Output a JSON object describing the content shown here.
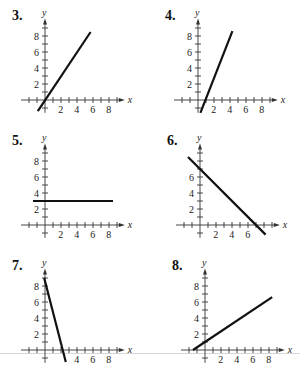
{
  "chart_data": [
    {
      "id": "3",
      "label": "3.",
      "type": "line",
      "xlabel": "x",
      "ylabel": "y",
      "xticks": [
        2,
        4,
        6,
        8
      ],
      "yticks": [
        2,
        4,
        6,
        8
      ],
      "origin_px": [
        45,
        100
      ],
      "segment": {
        "x1": -0.9,
        "y1": -1.4,
        "x2": 5.7,
        "y2": 8.5
      },
      "equation_estimate": "y = 1.5x"
    },
    {
      "id": "4",
      "label": "4.",
      "type": "line",
      "xlabel": "x",
      "ylabel": "y",
      "xticks": [
        2,
        4,
        6,
        8
      ],
      "yticks": [
        2,
        4,
        6,
        8
      ],
      "origin_px": [
        198,
        100
      ],
      "segment": {
        "x1": 0.3,
        "y1": -1.6,
        "x2": 4.3,
        "y2": 8.6
      },
      "equation_estimate": "y = 2.5x - 2"
    },
    {
      "id": "5",
      "label": "5.",
      "type": "line",
      "xlabel": "x",
      "ylabel": "y",
      "xticks": [
        2,
        4,
        6,
        8
      ],
      "yticks": [
        2,
        4,
        6,
        8
      ],
      "origin_px": [
        45,
        225
      ],
      "segment": {
        "x1": -1.5,
        "y1": 3,
        "x2": 8.5,
        "y2": 3
      },
      "equation_estimate": "y = 3"
    },
    {
      "id": "6",
      "label": "6.",
      "type": "line",
      "xlabel": "x",
      "ylabel": "y",
      "xticks": [
        2,
        4,
        6
      ],
      "yticks": [
        2,
        4,
        6
      ],
      "origin_px": [
        200,
        225
      ],
      "segment": {
        "x1": -1.5,
        "y1": 8.5,
        "x2": 8.2,
        "y2": -1.2
      },
      "equation_estimate": "y = -x + 7"
    },
    {
      "id": "7",
      "label": "7.",
      "type": "line",
      "xlabel": "x",
      "ylabel": "y",
      "xticks": [
        4,
        6,
        8
      ],
      "yticks": [
        2,
        4,
        6,
        8
      ],
      "origin_px": [
        45,
        350
      ],
      "segment": {
        "x1": -0.1,
        "y1": 9.0,
        "x2": 2.6,
        "y2": -1.5
      },
      "equation_estimate": "y = -3.8x + 8.6"
    },
    {
      "id": "8",
      "label": "8.",
      "type": "line",
      "xlabel": "x",
      "ylabel": "y",
      "xticks": [
        2,
        4,
        6,
        8
      ],
      "yticks": [
        2,
        4,
        6,
        8
      ],
      "origin_px": [
        205,
        350
      ],
      "segment": {
        "x1": -1.5,
        "y1": 0,
        "x2": 8.4,
        "y2": 6.6
      },
      "equation_estimate": "y = (2/3)x + 1"
    }
  ],
  "scale_px_per_unit": 8,
  "colors": {
    "line": "#111111",
    "axis": "#333333",
    "rule": "#d6d6d6"
  }
}
